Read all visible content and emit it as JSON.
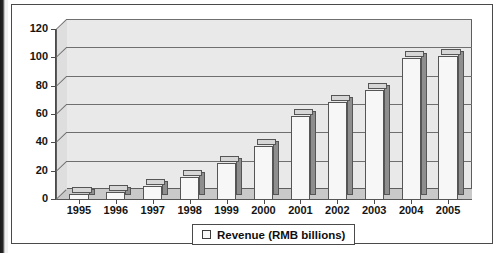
{
  "chart_data": {
    "type": "bar",
    "title": "",
    "subtitle": "",
    "xlabel": "",
    "ylabel": "",
    "categories": [
      "1995",
      "1996",
      "1997",
      "1998",
      "1999",
      "2000",
      "2001",
      "2002",
      "2003",
      "2004",
      "2005"
    ],
    "series": [
      {
        "name": "Revenue (RMB billions)",
        "values": [
          4,
          6,
          10,
          16,
          26,
          38,
          59,
          69,
          78,
          100,
          102
        ]
      }
    ],
    "values": [
      4,
      6,
      10,
      16,
      26,
      38,
      59,
      69,
      78,
      100,
      102
    ],
    "ylim": [
      0,
      120
    ],
    "ytick_labels": [
      "0",
      "20",
      "40",
      "60",
      "80",
      "100",
      "120"
    ],
    "ytick_values": [
      0,
      20,
      40,
      60,
      80,
      100,
      120
    ],
    "grid": true,
    "grid_axis": "y",
    "legend_position": "bottom-center",
    "style": "3d-column",
    "colors": {
      "bar_front": "#f7f7f7",
      "bar_side": "#8e8e8e",
      "bar_top": "#d6d6d6",
      "plot_background": "#e9e9e9",
      "floor": "#c9c9c9",
      "axis": "#4a4a4a",
      "gridline": "#6f6f6f",
      "text": "#141414",
      "frame": "#4a4a4a"
    }
  },
  "legend": {
    "entries": [
      {
        "label": "Revenue (RMB billions)",
        "marker": "legend-swatch-square"
      }
    ]
  }
}
